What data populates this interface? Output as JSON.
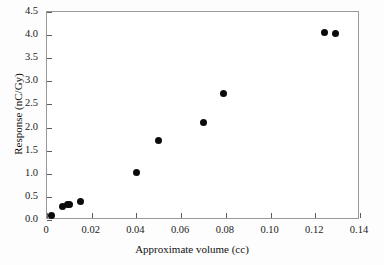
{
  "chart_data": {
    "type": "scatter",
    "title": "",
    "xlabel": "Approximate volume (cc)",
    "ylabel": "Response (nC/Gy)",
    "xlim": [
      0,
      0.14
    ],
    "ylim": [
      0.0,
      4.5
    ],
    "xticks": [
      0,
      0.02,
      0.04,
      0.06,
      0.08,
      0.1,
      0.12,
      0.14
    ],
    "xticklabels": [
      "0",
      "0.02",
      "0.04",
      "0.06",
      "0.08",
      "0.10",
      "0.12",
      "0.14"
    ],
    "yticks": [
      0.0,
      0.5,
      1.0,
      1.5,
      2.0,
      2.5,
      3.0,
      3.5,
      4.0,
      4.5
    ],
    "yticklabels": [
      "0.0",
      "0.5",
      "1.0",
      "1.5",
      "2.0",
      "2.5",
      "3.0",
      "3.5",
      "4.0",
      "4.5"
    ],
    "grid": false,
    "legend": null,
    "marker": "filled-circle",
    "marker_color": "#0b0b0b",
    "axis_color": "#9a9a9a",
    "background": "#ffffff",
    "x": [
      0.002,
      0.007,
      0.009,
      0.01,
      0.015,
      0.04,
      0.05,
      0.07,
      0.079,
      0.124,
      0.129
    ],
    "y": [
      0.09,
      0.3,
      0.33,
      0.34,
      0.41,
      1.02,
      1.72,
      2.12,
      2.73,
      4.05,
      4.04
    ],
    "points": [
      {
        "x": 0.002,
        "y": 0.09
      },
      {
        "x": 0.007,
        "y": 0.3
      },
      {
        "x": 0.009,
        "y": 0.33
      },
      {
        "x": 0.01,
        "y": 0.34
      },
      {
        "x": 0.015,
        "y": 0.41
      },
      {
        "x": 0.04,
        "y": 1.02
      },
      {
        "x": 0.05,
        "y": 1.72
      },
      {
        "x": 0.07,
        "y": 2.12
      },
      {
        "x": 0.079,
        "y": 2.73
      },
      {
        "x": 0.124,
        "y": 4.05
      },
      {
        "x": 0.129,
        "y": 4.04
      }
    ]
  }
}
